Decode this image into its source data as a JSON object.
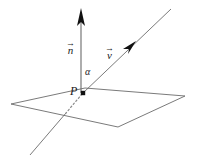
{
  "figure": {
    "background_color": "#ffffff",
    "stroke_color": "#555555",
    "accent_color": "#1a1a1a",
    "width": 198,
    "height": 159,
    "labels": {
      "normal_vector": {
        "name": "normal-vector-label",
        "letter": "n",
        "accent": "→",
        "full": "n⃗"
      },
      "direction_vector": {
        "name": "direction-vector-label",
        "letter": "v",
        "accent": "→",
        "full": "v⃗"
      },
      "angle": {
        "name": "angle-label",
        "text": "α"
      },
      "point": {
        "name": "point-label",
        "text": "P"
      }
    },
    "geometry": {
      "plane": {
        "name": "plane-parallelogram",
        "points": "11,104 85,88 185,96 118,127",
        "fill": "none",
        "stroke": "#6b6b6b",
        "stroke_width": 0.9
      },
      "normal_vector_line": {
        "name": "normal-vector-line",
        "x1": 81,
        "y1": 93,
        "x2": 81,
        "y2": 18,
        "stroke": "#6b6b6b",
        "stroke_width": 1.1
      },
      "normal_vector_arrowhead": {
        "name": "normal-vector-arrowhead",
        "points": "81,8 77,26 81,22 85,26",
        "fill": "#111111"
      },
      "direction_line_solid": {
        "name": "direction-line-solid",
        "x1": 83,
        "y1": 93,
        "x2": 171,
        "y2": 9,
        "stroke": "#6b6b6b",
        "stroke_width": 0.9
      },
      "direction_line_dotted": {
        "name": "direction-line-dotted",
        "x1": 82,
        "y1": 94,
        "x2": 66,
        "y2": 113,
        "stroke": "#8a8a8a",
        "stroke_width": 1.1,
        "dash": "1.6 2.4"
      },
      "direction_line_lower": {
        "name": "direction-line-lower-extension",
        "x1": 66,
        "y1": 113,
        "x2": 30,
        "y2": 155,
        "stroke": "#6b6b6b",
        "stroke_width": 0.9
      },
      "direction_arrowhead": {
        "name": "direction-vector-arrowhead",
        "points": "136,41 123,49 129,49 128,54",
        "fill": "#111111"
      },
      "point_marker": {
        "name": "point-marker-P",
        "cx": 83,
        "cy": 93,
        "size": 4.4,
        "fill": "#111111"
      }
    }
  }
}
